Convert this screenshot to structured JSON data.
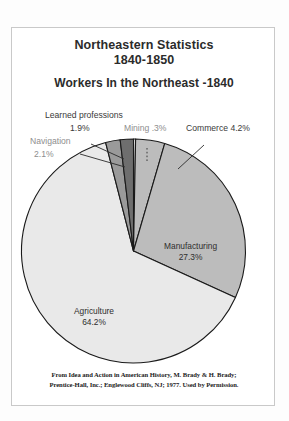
{
  "header": {
    "title_line1": "Northeastern Statistics",
    "title_line2": "1840-1850",
    "subtitle": "Workers In the Northeast  -1840"
  },
  "callouts": {
    "learned_name": "Learned professions",
    "learned_value": "1.9%",
    "navigation_name": "Navigation",
    "navigation_value": "2.1%",
    "mining": "Mining  .3%",
    "commerce": "Commerce 4.2%"
  },
  "slice_labels": {
    "manufacturing_name": "Manufacturing",
    "manufacturing_value": "27.3%",
    "agriculture_name": "Agriculture",
    "agriculture_value": "64.2%"
  },
  "credit": {
    "line1": "From Idea and Action in American History, M. Brady & H. Brady;",
    "line2": "Prentice-Hall, Inc.; Englewood Cliffs, NJ; 1977. Used by Permission."
  },
  "chart_data": {
    "type": "pie",
    "title": "Workers In the Northeast -1840",
    "subtitle": "Northeastern Statistics 1840-1850",
    "unit": "percent",
    "start_angle_deg": -90,
    "direction": "clockwise",
    "grid": false,
    "legend": "none",
    "labels_position": "mixed-inside-and-callout",
    "categories": [
      "Mining",
      "Commerce",
      "Manufacturing",
      "Agriculture",
      "Navigation",
      "Learned professions"
    ],
    "values": [
      0.3,
      4.2,
      27.3,
      64.2,
      2.1,
      1.9
    ],
    "slices": [
      {
        "name": "Mining",
        "value": 0.3,
        "display": ".3%",
        "color": "#e9e9e9",
        "label_style": "callout"
      },
      {
        "name": "Commerce",
        "value": 4.2,
        "display": "4.2%",
        "color": "#bcbcbc",
        "label_style": "callout"
      },
      {
        "name": "Manufacturing",
        "value": 27.3,
        "display": "27.3%",
        "color": "#bcbcbc",
        "label_style": "inside"
      },
      {
        "name": "Agriculture",
        "value": 64.2,
        "display": "64.2%",
        "color": "#e9e9e9",
        "label_style": "inside"
      },
      {
        "name": "Navigation",
        "value": 2.1,
        "display": "2.1%",
        "color": "#9a9a9a",
        "label_style": "callout"
      },
      {
        "name": "Learned professions",
        "value": 1.9,
        "display": "1.9%",
        "color": "#6e6e6e",
        "label_style": "callout"
      }
    ],
    "colors": {
      "agriculture": "#e9e9e9",
      "manufacturing": "#bcbcbc",
      "commerce": "#bcbcbc",
      "navigation": "#9a9a9a",
      "learned_professions": "#6e6e6e",
      "mining": "#efefef",
      "outline": "#1a1a1a"
    }
  }
}
